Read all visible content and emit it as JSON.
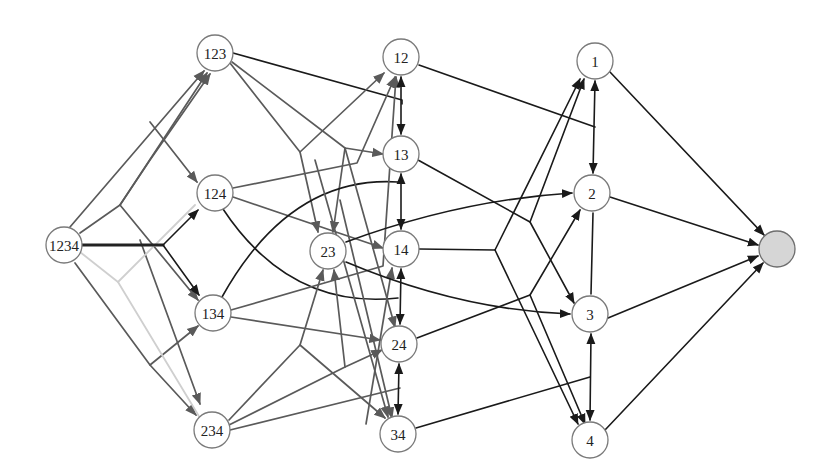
{
  "diagram": {
    "title": "",
    "colors": {
      "background": "#ffffff",
      "node_stroke": "#7a7a7a",
      "node_fill": "#ffffff",
      "sink_fill": "#d6d6d6",
      "edge_black": "#1a1a1a",
      "edge_gray": "#5a5a5a",
      "edge_light": "#cfcfcf"
    },
    "nodes": [
      {
        "id": "1234",
        "label": "1234",
        "x": 64,
        "y": 245,
        "r": 18
      },
      {
        "id": "123",
        "label": "123",
        "x": 215,
        "y": 53,
        "r": 18
      },
      {
        "id": "124",
        "label": "124",
        "x": 215,
        "y": 193,
        "r": 18
      },
      {
        "id": "134",
        "label": "134",
        "x": 213,
        "y": 313,
        "r": 18
      },
      {
        "id": "234",
        "label": "234",
        "x": 212,
        "y": 430,
        "r": 18
      },
      {
        "id": "12",
        "label": "12",
        "x": 401,
        "y": 57,
        "r": 18
      },
      {
        "id": "13",
        "label": "13",
        "x": 401,
        "y": 154,
        "r": 18
      },
      {
        "id": "23",
        "label": "23",
        "x": 328,
        "y": 251,
        "r": 18
      },
      {
        "id": "14",
        "label": "14",
        "x": 401,
        "y": 249,
        "r": 18
      },
      {
        "id": "24",
        "label": "24",
        "x": 399,
        "y": 344,
        "r": 18
      },
      {
        "id": "34",
        "label": "34",
        "x": 398,
        "y": 434,
        "r": 18
      },
      {
        "id": "1",
        "label": "1",
        "x": 595,
        "y": 61,
        "r": 18
      },
      {
        "id": "2",
        "label": "2",
        "x": 592,
        "y": 193,
        "r": 18
      },
      {
        "id": "3",
        "label": "3",
        "x": 590,
        "y": 314,
        "r": 18
      },
      {
        "id": "4",
        "label": "4",
        "x": 590,
        "y": 440,
        "r": 18
      },
      {
        "id": "sink",
        "label": "",
        "x": 777,
        "y": 249,
        "r": 18,
        "sink": true
      }
    ],
    "edges": [
      {
        "style": "gray",
        "d": "M70,227 L204,71",
        "arrow_end": true
      },
      {
        "style": "gray",
        "d": "M80,233 L120,205 L207,73",
        "arrow_end": true
      },
      {
        "style": "gray",
        "d": "M120,205 L150,160 L210,74",
        "arrow_end": true
      },
      {
        "style": "gray",
        "d": "M150,122 L197,182",
        "arrow_end": true
      },
      {
        "style": "gray",
        "d": "M120,205 L198,300",
        "arrow_end": true
      },
      {
        "style": "gray",
        "d": "M140,240 L200,404",
        "arrow_end": true
      },
      {
        "style": "gray",
        "d": "M75,263 L150,365 L196,415",
        "arrow_end": true
      },
      {
        "style": "gray",
        "d": "M150,365 L198,326",
        "arrow_end": true
      },
      {
        "style": "light",
        "d": "M80,252 L118,282 L195,205",
        "arrow_end": false
      },
      {
        "style": "light",
        "d": "M118,282 L200,418",
        "arrow_end": false
      },
      {
        "style": "thick",
        "d": "M82,245 L163,245",
        "arrow_end": false
      },
      {
        "style": "black",
        "d": "M163,245 L198,210",
        "arrow_end": true
      },
      {
        "style": "black",
        "d": "M163,245 L199,295",
        "arrow_end": true
      },
      {
        "style": "black",
        "d": "M233,53 L402,100 L402,104",
        "arrow_end": false
      },
      {
        "style": "gray",
        "d": "M230,63 L300,152 L384,73",
        "arrow_end": true
      },
      {
        "style": "gray",
        "d": "M300,152 L318,232",
        "arrow_end": true
      },
      {
        "style": "gray",
        "d": "M232,62 L345,148 L383,154",
        "arrow_end": true
      },
      {
        "style": "gray",
        "d": "M345,148 L333,232",
        "arrow_end": true
      },
      {
        "style": "gray",
        "d": "M233,188 L357,163 L395,77",
        "arrow_end": true
      },
      {
        "style": "gray",
        "d": "M233,197 L383,248",
        "arrow_end": true
      },
      {
        "style": "black",
        "d": "M223,209 Q290,310 398,298",
        "arrow_end": false
      },
      {
        "style": "black",
        "d": "M222,297 Q290,175 398,182",
        "arrow_end": false
      },
      {
        "style": "gray",
        "d": "M231,310 L383,266 L396,77",
        "arrow_end": true
      },
      {
        "style": "gray",
        "d": "M231,317 L380,340",
        "arrow_end": true
      },
      {
        "style": "gray",
        "d": "M229,420 L300,345 L323,270",
        "arrow_end": true
      },
      {
        "style": "gray",
        "d": "M300,345 L385,418",
        "arrow_end": true
      },
      {
        "style": "gray",
        "d": "M229,425 L345,367 L382,350",
        "arrow_end": true
      },
      {
        "style": "gray",
        "d": "M345,367 L334,270",
        "arrow_end": true
      },
      {
        "style": "gray",
        "d": "M230,430 L400,388",
        "arrow_end": false
      },
      {
        "style": "gray",
        "d": "M315,160 L388,417",
        "arrow_end": true
      },
      {
        "style": "gray",
        "d": "M345,148 L395,327",
        "arrow_end": true
      },
      {
        "style": "gray",
        "d": "M340,200 L392,418",
        "arrow_end": true
      },
      {
        "style": "gray",
        "d": "M366,424 L392,268",
        "arrow_end": true
      },
      {
        "style": "black",
        "d": "M401,77 L401,134",
        "arrow_end": true,
        "arrow_start": true
      },
      {
        "style": "black",
        "d": "M401,174 L401,229",
        "arrow_end": true,
        "arrow_start": true
      },
      {
        "style": "black",
        "d": "M401,269 L400,324",
        "arrow_end": true,
        "arrow_start": true
      },
      {
        "style": "black",
        "d": "M399,364 L398,414",
        "arrow_end": true,
        "arrow_start": true
      },
      {
        "style": "black",
        "d": "M419,65 L595,127",
        "arrow_end": false
      },
      {
        "style": "black",
        "d": "M595,81 L593,173",
        "arrow_end": true,
        "arrow_start": true
      },
      {
        "style": "black",
        "d": "M593,213 L591,294",
        "arrow_end": false
      },
      {
        "style": "black",
        "d": "M591,334 L590,420",
        "arrow_end": true,
        "arrow_start": true
      },
      {
        "style": "black",
        "d": "M418,160 L530,222 L574,303",
        "arrow_end": true
      },
      {
        "style": "black",
        "d": "M530,222 L584,79",
        "arrow_end": true
      },
      {
        "style": "black",
        "d": "M346,242 Q460,200 572,193",
        "arrow_end": true
      },
      {
        "style": "black",
        "d": "M346,262 Q460,310 570,314",
        "arrow_end": true
      },
      {
        "style": "black",
        "d": "M419,249 L495,250 L580,79",
        "arrow_end": true
      },
      {
        "style": "black",
        "d": "M495,250 L578,424",
        "arrow_end": true
      },
      {
        "style": "black",
        "d": "M417,338 L530,295 L580,210",
        "arrow_end": true
      },
      {
        "style": "black",
        "d": "M530,295 L585,424",
        "arrow_end": true
      },
      {
        "style": "black",
        "d": "M416,428 L590,377",
        "arrow_end": false
      },
      {
        "style": "black",
        "d": "M610,72 L764,235",
        "arrow_end": true
      },
      {
        "style": "black",
        "d": "M610,197 L758,245",
        "arrow_end": true
      },
      {
        "style": "black",
        "d": "M608,318 L758,256",
        "arrow_end": true
      },
      {
        "style": "black",
        "d": "M605,430 L763,263",
        "arrow_end": true
      }
    ]
  }
}
